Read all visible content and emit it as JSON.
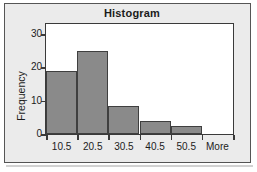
{
  "chart_data": {
    "type": "bar",
    "title": "Histogram",
    "xlabel": "",
    "ylabel": "Frequency",
    "categories": [
      "10.5",
      "20.5",
      "30.5",
      "40.5",
      "50.5",
      "More"
    ],
    "values": [
      19,
      25,
      8.5,
      4,
      2.5,
      0
    ],
    "ylim": [
      0,
      33
    ],
    "yticks": [
      0,
      10,
      20,
      30
    ],
    "ytick_labels": [
      "0",
      "10",
      "20",
      "30"
    ],
    "grid": false,
    "legend": false,
    "bar_color": "#8a8a8a",
    "bar_edge_color": "#3f3f3f",
    "plot_background": "#ffffff",
    "panel_background": "#ebebeb",
    "axis_color": "#3a3a3a",
    "text_color": "#1b1b1b"
  }
}
